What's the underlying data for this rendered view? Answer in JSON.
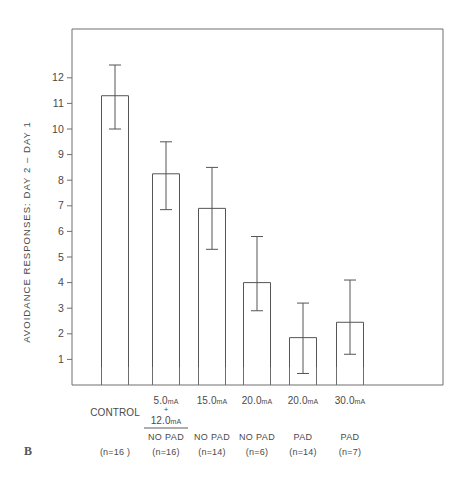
{
  "panel": {
    "label": "B"
  },
  "axes": {
    "y_title": "AVOIDANCE RESPONSES: DAY 2 – DAY 1",
    "y_ticks": [
      "1",
      "2",
      "3",
      "4",
      "5",
      "6",
      "7",
      "8",
      "9",
      "10",
      "11",
      "12"
    ]
  },
  "chart_data": {
    "type": "bar",
    "title": "",
    "xlabel": "",
    "ylabel": "AVOIDANCE RESPONSES: DAY 2 – DAY 1",
    "ylim": [
      0,
      13
    ],
    "grid": false,
    "legend": "none",
    "error_bars": "vertical capped whiskers centered on each bar",
    "categories": [
      "CONTROL",
      "5.0mA + 12.0mA NO PAD",
      "15.0mA NO PAD",
      "20.0mA NO PAD",
      "20.0mA PAD",
      "30.0mA PAD"
    ],
    "values": [
      11.3,
      8.25,
      6.9,
      4.0,
      1.85,
      2.45
    ],
    "error_upper": [
      12.5,
      9.5,
      8.5,
      5.8,
      3.2,
      4.1
    ],
    "error_lower": [
      10.0,
      6.85,
      5.3,
      2.9,
      0.45,
      1.2
    ],
    "n": [
      16,
      16,
      14,
      6,
      14,
      7
    ],
    "groups": [
      {
        "current_line1": "",
        "current_value": "",
        "unit": "",
        "name": "CONTROL",
        "has_fraction": false,
        "pad": "",
        "n_label": "(n=16 )",
        "value": 11.3,
        "err_top": 12.5,
        "err_bottom": 10.0
      },
      {
        "current_line1": "5.0",
        "current_line2": "12.0",
        "unit": "mA",
        "plus": "+",
        "name": "",
        "has_fraction": true,
        "pad": "NO  PAD",
        "n_label": "(n=16)",
        "value": 8.25,
        "err_top": 9.5,
        "err_bottom": 6.85
      },
      {
        "current_line1": "15.0",
        "unit": "mA",
        "name": "",
        "has_fraction": false,
        "pad": "NO PAD",
        "n_label": "(n=14)",
        "value": 6.9,
        "err_top": 8.5,
        "err_bottom": 5.3
      },
      {
        "current_line1": "20.0",
        "unit": "mA",
        "name": "",
        "has_fraction": false,
        "pad": "NO PAD",
        "n_label": "(n=6)",
        "value": 4.0,
        "err_top": 5.8,
        "err_bottom": 2.9
      },
      {
        "current_line1": "20.0",
        "unit": "mA",
        "name": "",
        "has_fraction": false,
        "pad": "PAD",
        "n_label": "(n=14)",
        "value": 1.85,
        "err_top": 3.2,
        "err_bottom": 0.45
      },
      {
        "current_line1": "30.0",
        "unit": "mA",
        "name": "",
        "has_fraction": false,
        "pad": "PAD",
        "n_label": "(n=7)",
        "value": 2.45,
        "err_top": 4.1,
        "err_bottom": 1.2
      }
    ]
  },
  "style": {
    "line_color": "#555555",
    "frame_color": "#6f6f6f",
    "text_color": "#4a4a4a",
    "background": "#ffffff"
  }
}
